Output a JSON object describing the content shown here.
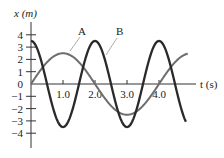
{
  "chart_data": {
    "type": "line",
    "title": "",
    "xlabel": "t (s)",
    "ylabel": "x (m)",
    "x_ticks": [
      "1.0",
      "2.0",
      "3.0",
      "4.0"
    ],
    "y_ticks": [
      "4",
      "3",
      "2",
      "1",
      "0",
      "−1",
      "−2",
      "−3",
      "−4"
    ],
    "xlim": [
      0,
      5.2
    ],
    "ylim": [
      -5,
      5
    ],
    "grid": false,
    "legend": "inline labels",
    "series": [
      {
        "name": "A",
        "description": "x = 2.5 sin(π t / 2)",
        "amplitude": 2.5,
        "period": 4.0,
        "color": "#6e6e6e",
        "t": [
          0,
          0.5,
          1.0,
          1.5,
          2.0,
          2.5,
          3.0,
          3.5,
          4.0,
          4.5,
          4.9
        ],
        "x": [
          0,
          1.77,
          2.5,
          1.77,
          0,
          -1.77,
          -2.5,
          -1.77,
          0,
          1.77,
          2.47
        ]
      },
      {
        "name": "B",
        "description": "x = 3.5 cos(π t)",
        "amplitude": 3.5,
        "period": 2.0,
        "color": "#2a2a2a",
        "t": [
          0,
          0.5,
          1.0,
          1.5,
          2.0,
          2.5,
          3.0,
          3.5,
          4.0,
          4.5,
          4.9
        ],
        "x": [
          3.5,
          0,
          -3.5,
          0,
          3.5,
          0,
          -3.5,
          0,
          3.5,
          0,
          -3.33
        ]
      }
    ]
  },
  "labels": {
    "y_axis": "x (m)",
    "x_axis": "t (s)",
    "curve_a": "A",
    "curve_b": "B"
  }
}
